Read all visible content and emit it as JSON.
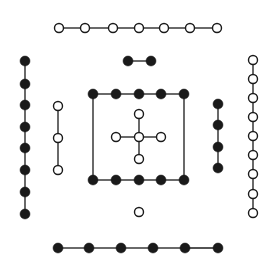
{
  "diagram": {
    "title": "",
    "colors": {
      "background": "#ffffff",
      "ink": "#1a1a1a",
      "open_fill": "#ffffff"
    },
    "groups": [
      {
        "name": "top-row-7-open",
        "kind": "open",
        "points": [
          [
            59,
            28
          ],
          [
            85,
            28
          ],
          [
            113,
            28
          ],
          [
            139,
            28
          ],
          [
            164,
            28
          ],
          [
            190,
            28
          ],
          [
            217,
            28
          ]
        ],
        "closed": false
      },
      {
        "name": "top-pair-2-filled",
        "kind": "filled",
        "points": [
          [
            128,
            61
          ],
          [
            151,
            61
          ]
        ],
        "closed": false
      },
      {
        "name": "left-column-8-filled",
        "kind": "filled",
        "points": [
          [
            25,
            61
          ],
          [
            25,
            84
          ],
          [
            25,
            105
          ],
          [
            25,
            127
          ],
          [
            25,
            148
          ],
          [
            25,
            170
          ],
          [
            25,
            192
          ],
          [
            25,
            214
          ]
        ],
        "closed": false
      },
      {
        "name": "left-inner-3-open",
        "kind": "open",
        "points": [
          [
            58,
            106
          ],
          [
            58,
            138
          ],
          [
            58,
            170
          ]
        ],
        "closed": false
      },
      {
        "name": "square-top-5-filled",
        "kind": "filled",
        "points": [
          [
            93,
            94
          ],
          [
            116,
            94
          ],
          [
            139,
            94
          ],
          [
            161,
            94
          ],
          [
            184,
            94
          ]
        ],
        "closed": false
      },
      {
        "name": "square-bottom-5-filled",
        "kind": "filled",
        "points": [
          [
            93,
            180
          ],
          [
            116,
            180
          ],
          [
            139,
            180
          ],
          [
            161,
            180
          ],
          [
            184,
            180
          ]
        ],
        "closed": false
      },
      {
        "name": "center-cross-5-open",
        "kind": "open",
        "points": [
          [
            139,
            114
          ],
          [
            116,
            137
          ],
          [
            139,
            137
          ],
          [
            161,
            137
          ],
          [
            139,
            159
          ]
        ],
        "closed": false,
        "cross": true
      },
      {
        "name": "bottom-center-1-open",
        "kind": "open",
        "points": [
          [
            139,
            212
          ]
        ],
        "closed": false
      },
      {
        "name": "right-inner-4-filled",
        "kind": "filled",
        "points": [
          [
            218,
            104
          ],
          [
            218,
            125
          ],
          [
            218,
            147
          ],
          [
            218,
            168
          ]
        ],
        "closed": false
      },
      {
        "name": "right-column-9-open",
        "kind": "open",
        "points": [
          [
            253,
            60
          ],
          [
            253,
            79
          ],
          [
            253,
            98
          ],
          [
            253,
            117
          ],
          [
            253,
            136
          ],
          [
            253,
            155
          ],
          [
            253,
            174
          ],
          [
            253,
            194
          ],
          [
            253,
            213
          ]
        ],
        "closed": false
      },
      {
        "name": "bottom-row-6-filled",
        "kind": "filled",
        "points": [
          [
            58,
            248
          ],
          [
            89,
            248
          ],
          [
            121,
            248
          ],
          [
            153,
            248
          ],
          [
            185,
            248
          ],
          [
            218,
            248
          ]
        ],
        "closed": false
      }
    ],
    "extra_lines": [
      {
        "name": "square-left-side",
        "from": [
          93,
          94
        ],
        "to": [
          93,
          180
        ]
      },
      {
        "name": "square-right-side",
        "from": [
          184,
          94
        ],
        "to": [
          184,
          180
        ]
      }
    ],
    "dot_radius": 5
  }
}
